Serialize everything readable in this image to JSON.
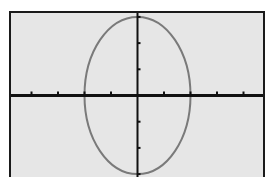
{
  "chart_data": {
    "type": "line",
    "title": "",
    "xlabel": "",
    "ylabel": "",
    "equation": "x^2/4 + y^2/9 = 1",
    "center": [
      0,
      0
    ],
    "semi_axis_x": 2,
    "semi_axis_y": 3,
    "xlim": [
      -4.8,
      4.8
    ],
    "ylim": [
      -3.2,
      3.2
    ],
    "x_ticks": [
      -4,
      -3,
      -2,
      -1,
      1,
      2,
      3,
      4
    ],
    "y_ticks": [
      -3,
      -2,
      -1,
      1,
      2,
      3
    ],
    "grid": false,
    "legend": "none",
    "series": [
      {
        "name": "ellipse",
        "color": "#7a7a7a",
        "points": [
          [
            2,
            0
          ],
          [
            1.732,
            1.5
          ],
          [
            1,
            2.598
          ],
          [
            0,
            3
          ],
          [
            -1,
            2.598
          ],
          [
            -1.732,
            1.5
          ],
          [
            -2,
            0
          ],
          [
            -1.732,
            -1.5
          ],
          [
            -1,
            -2.598
          ],
          [
            0,
            -3
          ],
          [
            1,
            -2.598
          ],
          [
            1.732,
            -1.5
          ]
        ]
      }
    ]
  },
  "colors": {
    "screen_bg": "#e6e6e6",
    "axis": "#111111",
    "curve": "#7a7a7a",
    "border": "#1a1a1a"
  }
}
